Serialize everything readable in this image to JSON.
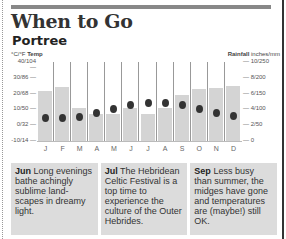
{
  "header": {
    "title": "When to Go",
    "subtitle": "Portree"
  },
  "chart_data": {
    "type": "bar+scatter",
    "title": "When to Go",
    "subtitle": "Portree",
    "categories": [
      "J",
      "F",
      "M",
      "A",
      "M",
      "J",
      "J",
      "A",
      "S",
      "O",
      "N",
      "D"
    ],
    "series": [
      {
        "name": "Rainfall (mm)",
        "type": "bar",
        "axis": "right",
        "values": [
          158,
          171,
          104,
          85,
          85,
          104,
          85,
          104,
          146,
          165,
          168,
          174
        ]
      },
      {
        "name": "Temp (°C)",
        "type": "scatter",
        "axis": "left",
        "values": [
          4.5,
          4.5,
          5,
          8,
          10,
          13,
          14,
          14,
          13,
          10,
          8,
          6
        ]
      }
    ],
    "left_axis": {
      "label_units": "°C/°F",
      "label_name": "Temp",
      "ticks": [
        "40/104",
        "30/86",
        "20/68",
        "10/50",
        "0/32",
        "-10/14"
      ],
      "range_c": [
        -10,
        40
      ]
    },
    "right_axis": {
      "label_name": "Rainfall",
      "label_units": "inches/mm",
      "ticks": [
        "10/250",
        "8/200",
        "6/150",
        "4/100",
        "2/50",
        "0"
      ],
      "range_mm": [
        0,
        250
      ]
    },
    "grid": false,
    "legend": "none"
  },
  "notes": [
    {
      "month": "Jun",
      "text": "Long evenings bathe achingly sublime land-scapes in dreamy light."
    },
    {
      "month": "Jul",
      "text": "The Hebridean Celtic Festival is a top time to experience the culture of the Outer Hebrides."
    },
    {
      "month": "Sep",
      "text": "Less busy than summer, the midges have gone and temperatures are (maybe!) still OK."
    }
  ]
}
